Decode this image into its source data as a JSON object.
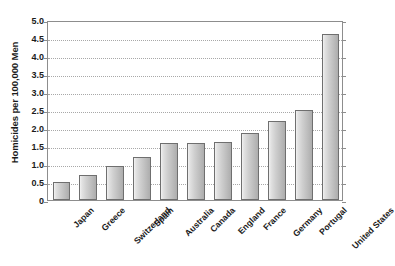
{
  "chart_data": {
    "type": "bar",
    "title": "",
    "xlabel": "",
    "ylabel": "Homicides per 100,000 Men",
    "categories": [
      "Japan",
      "Greece",
      "Switzerland",
      "Spain",
      "Australia",
      "Canada",
      "England",
      "France",
      "Germany",
      "Portugal",
      "United States"
    ],
    "values": [
      0.5,
      0.7,
      0.95,
      1.2,
      1.57,
      1.57,
      1.6,
      1.85,
      2.2,
      2.5,
      4.6
    ],
    "ylim": [
      0,
      5.0
    ],
    "ytick_labels": [
      "5.0",
      "4.5",
      "4.0",
      "3.5",
      "3.0",
      "2.5",
      "2.0",
      "1.5",
      "1.0",
      "0.5",
      "0"
    ],
    "ytick_values": [
      5.0,
      4.5,
      4.0,
      3.5,
      3.0,
      2.5,
      2.0,
      1.5,
      1.0,
      0.5,
      0
    ],
    "grid": true,
    "grid_style": "dotted",
    "legend": "none",
    "bar_fill_light": "#f2f2f2",
    "bar_fill_dark": "#adadad",
    "bar_border_color": "#6f6f6f",
    "axis_color": "#8d8d8d",
    "grid_color": "#a8a8a8",
    "text_color": "#1b1b1b",
    "background": "#ffffff"
  }
}
